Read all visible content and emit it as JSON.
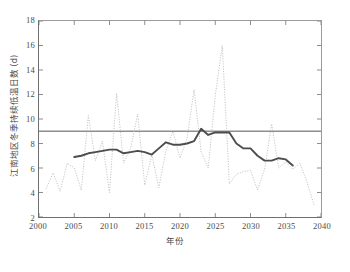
{
  "chart_data": {
    "type": "line",
    "title": "",
    "xlabel": "年份",
    "ylabel": "江南地区冬季持续低温日数 (d)",
    "xlim": [
      2000,
      2040
    ],
    "ylim": [
      2,
      18
    ],
    "xticks": [
      2000,
      2005,
      2010,
      2015,
      2020,
      2025,
      2030,
      2035,
      2040
    ],
    "yticks": [
      2,
      4,
      6,
      8,
      10,
      12,
      14,
      16,
      18
    ],
    "grid": false,
    "legend": "none",
    "colors": {
      "annual": "#b9b9b9",
      "smoothed": "#4d4d4d",
      "reference": "#8e8e8e",
      "axis": "#6f6f6f",
      "text": "#4a4a4a"
    },
    "reference_line": {
      "name": "平均值",
      "value": 9.0
    },
    "series": [
      {
        "name": "逐年低温日数",
        "style": "dotted",
        "x": [
          2001,
          2002,
          2003,
          2004,
          2005,
          2006,
          2007,
          2008,
          2009,
          2010,
          2011,
          2012,
          2013,
          2014,
          2015,
          2016,
          2017,
          2018,
          2019,
          2020,
          2021,
          2022,
          2023,
          2024,
          2025,
          2026,
          2027,
          2028,
          2029,
          2030,
          2031,
          2032,
          2033,
          2034,
          2035,
          2036,
          2037,
          2038,
          2039
        ],
        "values": [
          4.3,
          5.6,
          4.1,
          6.4,
          6.0,
          4.2,
          10.3,
          6.6,
          8.2,
          4.0,
          12.1,
          6.4,
          7.6,
          10.4,
          4.6,
          7.1,
          4.4,
          7.4,
          9.0,
          6.8,
          8.4,
          12.4,
          7.3,
          6.0,
          11.9,
          16.0,
          4.7,
          5.5,
          5.7,
          5.8,
          4.2,
          5.9,
          9.6,
          6.0,
          6.5,
          5.9,
          6.4,
          4.9,
          3.0
        ]
      },
      {
        "name": "滑动平均",
        "style": "solid-thick",
        "x": [
          2005,
          2006,
          2007,
          2008,
          2009,
          2010,
          2011,
          2012,
          2013,
          2014,
          2015,
          2016,
          2017,
          2018,
          2019,
          2020,
          2021,
          2022,
          2023,
          2024,
          2025,
          2026,
          2027,
          2028,
          2029,
          2030,
          2031,
          2032,
          2033,
          2034,
          2035,
          2036
        ],
        "values": [
          6.9,
          7.0,
          7.2,
          7.3,
          7.4,
          7.5,
          7.5,
          7.2,
          7.3,
          7.4,
          7.3,
          7.1,
          7.6,
          8.1,
          7.9,
          7.9,
          8.0,
          8.2,
          9.2,
          8.7,
          8.9,
          8.9,
          8.9,
          8.0,
          7.6,
          7.6,
          7.0,
          6.6,
          6.6,
          6.8,
          6.7,
          6.2
        ]
      }
    ]
  },
  "caption": ""
}
